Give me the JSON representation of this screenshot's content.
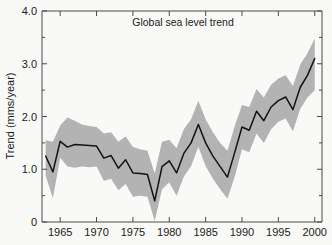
{
  "chart_data": {
    "type": "line",
    "title": "Global sea level trend",
    "xlabel": "",
    "ylabel": "Trend (mms/year)",
    "xlim": [
      1962.5,
      2001.0
    ],
    "ylim": [
      0,
      4.0
    ],
    "grid": false,
    "legend": "none",
    "y_ticks_major": [
      "0",
      "1.0",
      "2.0",
      "3.0",
      "4.0"
    ],
    "y_ticks_major_values": [
      0,
      1.0,
      2.0,
      3.0,
      4.0
    ],
    "y_ticks_minor_values": [
      0.5,
      1.5,
      2.5,
      3.5
    ],
    "x_ticks": [
      "1965",
      "1970",
      "1975",
      "1980",
      "1985",
      "1990",
      "1995",
      "2000"
    ],
    "x_ticks_values": [
      1965,
      1970,
      1975,
      1980,
      1985,
      1990,
      1995,
      2000
    ],
    "colors": {
      "line": "#121212",
      "band": "#b3b3b3",
      "frame": "#4a4a4a",
      "background": "#f9f9f7",
      "text": "#1a1a1a"
    },
    "series": [
      {
        "name": "Trend",
        "x": [
          1963,
          1964,
          1965,
          1966,
          1967,
          1968,
          1969,
          1970,
          1971,
          1972,
          1973,
          1974,
          1975,
          1976,
          1977,
          1978,
          1979,
          1980,
          1981,
          1982,
          1983,
          1984,
          1985,
          1986,
          1987,
          1988,
          1989,
          1990,
          1991,
          1992,
          1993,
          1994,
          1995,
          1996,
          1997,
          1998,
          1999,
          2000
        ],
        "values": [
          1.25,
          0.95,
          1.53,
          1.42,
          1.47,
          1.46,
          1.45,
          1.44,
          1.21,
          1.26,
          1.02,
          1.18,
          0.93,
          0.92,
          0.9,
          0.4,
          1.05,
          1.16,
          0.93,
          1.3,
          1.5,
          1.85,
          1.5,
          1.25,
          1.05,
          0.85,
          1.32,
          1.8,
          1.74,
          2.1,
          1.92,
          2.18,
          2.3,
          2.37,
          2.13,
          2.55,
          2.78,
          3.1
        ]
      }
    ],
    "uncertainty_band": {
      "name": "confidence band",
      "x": [
        1963,
        1964,
        1965,
        1966,
        1967,
        1968,
        1969,
        1970,
        1971,
        1972,
        1973,
        1974,
        1975,
        1976,
        1977,
        1978,
        1979,
        1980,
        1981,
        1982,
        1983,
        1984,
        1985,
        1986,
        1987,
        1988,
        1989,
        1990,
        1991,
        1992,
        1993,
        1994,
        1995,
        1996,
        1997,
        1998,
        1999,
        2000
      ],
      "upper": [
        1.55,
        1.52,
        1.83,
        1.98,
        1.92,
        1.85,
        1.82,
        1.8,
        1.68,
        1.7,
        1.52,
        1.62,
        1.42,
        1.38,
        1.35,
        0.92,
        1.52,
        1.56,
        1.4,
        1.76,
        1.95,
        2.3,
        1.95,
        1.7,
        1.5,
        1.35,
        1.82,
        2.22,
        2.18,
        2.52,
        2.36,
        2.6,
        2.72,
        2.78,
        2.58,
        2.98,
        3.2,
        3.48
      ],
      "lower": [
        0.88,
        0.45,
        1.22,
        1.05,
        1.03,
        1.05,
        1.04,
        1.05,
        0.78,
        0.82,
        0.6,
        0.72,
        0.48,
        0.5,
        0.48,
        0.02,
        0.62,
        0.75,
        0.5,
        0.86,
        1.06,
        1.42,
        1.06,
        0.82,
        0.62,
        0.44,
        0.86,
        1.38,
        1.32,
        1.68,
        1.5,
        1.76,
        1.9,
        1.96,
        1.72,
        2.14,
        2.36,
        2.5
      ]
    }
  }
}
